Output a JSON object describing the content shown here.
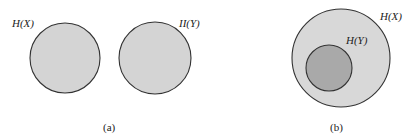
{
  "figure": {
    "panels": [
      {
        "caption": "(a)",
        "circles": [
          {
            "label": "H(X)",
            "cx": 65,
            "cy": 58,
            "r": 35,
            "fill": "#d4d4d4"
          },
          {
            "label": "II(Y)",
            "cx": 155,
            "cy": 58,
            "r": 36,
            "fill": "#d4d4d4"
          }
        ]
      },
      {
        "caption": "(b)",
        "circles": [
          {
            "label": "H(X)",
            "cx": 341,
            "cy": 58,
            "r": 49,
            "fill": "#d8d8d8"
          },
          {
            "label": "H(Y)",
            "cx": 329,
            "cy": 68,
            "r": 23,
            "fill": "#a9a9a9"
          }
        ]
      }
    ]
  },
  "colors": {
    "stroke": "#333333",
    "light_fill": "#d4d4d4",
    "dark_fill": "#a9a9a9",
    "background": "#ffffff"
  }
}
